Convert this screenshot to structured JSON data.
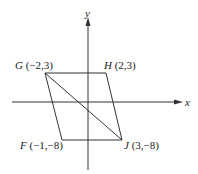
{
  "diagram": {
    "type": "coordinate-plane-parallelogram",
    "axes": {
      "x_label": "x",
      "y_label": "y"
    },
    "points": [
      {
        "name": "G",
        "coords": "(−2,3)"
      },
      {
        "name": "H",
        "coords": "(2,3)"
      },
      {
        "name": "F",
        "coords": "(−1,−8)"
      },
      {
        "name": "J",
        "coords": "(3,−8)"
      }
    ],
    "segments": [
      "GH",
      "HJ",
      "JF",
      "FG",
      "GJ"
    ],
    "colors": {
      "line": "#333333",
      "text": "#222222",
      "background": "#ffffff"
    }
  }
}
